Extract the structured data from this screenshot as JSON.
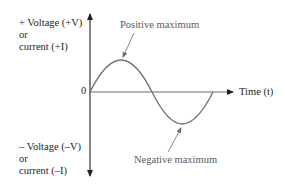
{
  "diagram": {
    "type": "sine-wave",
    "y_axis": {
      "positive_label_line1": "+ Voltage (+V)",
      "positive_label_line2": "or",
      "positive_label_line3": "current (+I)",
      "negative_label_line1": "– Voltage (–V)",
      "negative_label_line2": "or",
      "negative_label_line3": "current (–I)"
    },
    "x_axis": {
      "label": "Time (t)",
      "origin_label": "0"
    },
    "annotations": {
      "positive_max": "Positive maximum",
      "negative_max": "Negative maximum"
    },
    "colors": {
      "axis": "#231f20",
      "wave": "#6d6e71",
      "callout_text": "#5a5a5a",
      "background": "#ffffff"
    }
  }
}
